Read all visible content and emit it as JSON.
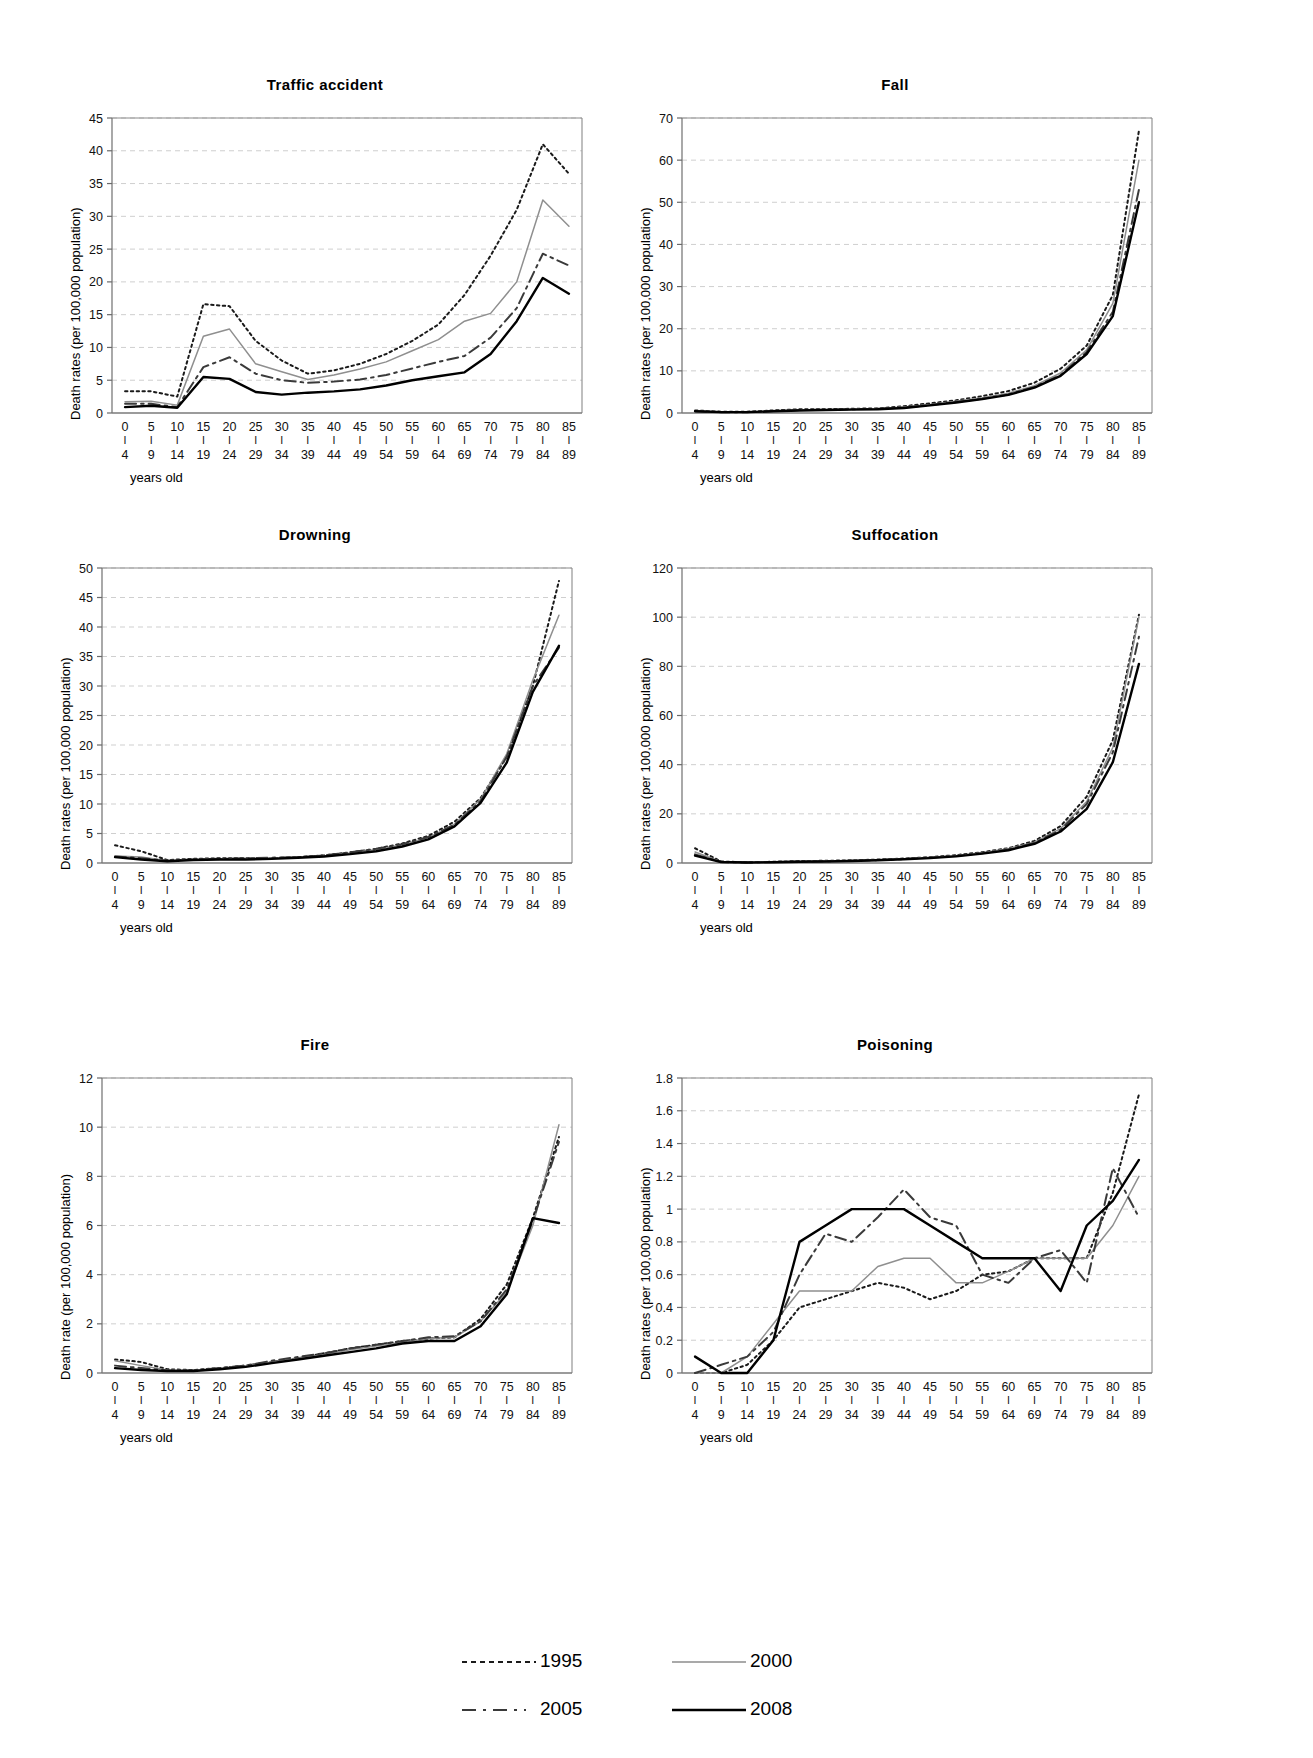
{
  "figure": {
    "xlabel": "years old",
    "ylabel_plural": "Death rates (per 100,000 population)",
    "ylabel_singular": "Death rate (per 100,000 population)",
    "age_top": [
      "0",
      "5",
      "10",
      "15",
      "20",
      "25",
      "30",
      "35",
      "40",
      "45",
      "50",
      "55",
      "60",
      "65",
      "70",
      "75",
      "80",
      "85"
    ],
    "age_bottom": [
      "4",
      "9",
      "14",
      "19",
      "24",
      "29",
      "34",
      "39",
      "44",
      "49",
      "54",
      "59",
      "64",
      "69",
      "74",
      "79",
      "84",
      "89"
    ],
    "tick_dash": "I"
  },
  "legend": {
    "position": "bottom-center",
    "items": [
      {
        "label": "1995",
        "style": "dotted",
        "color": "#1a1a1a"
      },
      {
        "label": "2000",
        "style": "solid-thin",
        "color": "#8c8c8c"
      },
      {
        "label": "2005",
        "style": "dash-dot",
        "color": "#3a3a3a"
      },
      {
        "label": "2008",
        "style": "solid-thick",
        "color": "#000000"
      }
    ]
  },
  "chart_data": [
    {
      "type": "line",
      "title": "Traffic accident",
      "xlabel": "years old",
      "ylabel": "Death rates (per 100,000 population)",
      "grid": true,
      "ylim": [
        0,
        45
      ],
      "yticks": [
        0,
        5,
        10,
        15,
        20,
        25,
        30,
        35,
        40,
        45
      ],
      "categories": [
        "0-4",
        "5-9",
        "10-14",
        "15-19",
        "20-24",
        "25-29",
        "30-34",
        "35-39",
        "40-44",
        "45-49",
        "50-54",
        "55-59",
        "60-64",
        "65-69",
        "70-74",
        "75-79",
        "80-84",
        "85-89"
      ],
      "series": [
        {
          "name": "1995",
          "values": [
            3.3,
            3.3,
            2.5,
            16.6,
            16.3,
            11.0,
            8.0,
            6.0,
            6.5,
            7.5,
            9.0,
            11.0,
            13.5,
            18.0,
            24.0,
            31.0,
            41.0,
            36.5
          ]
        },
        {
          "name": "2000",
          "values": [
            1.7,
            1.8,
            1.2,
            11.7,
            12.8,
            7.5,
            6.3,
            5.1,
            5.8,
            6.7,
            7.8,
            9.5,
            11.2,
            14.0,
            15.2,
            20.0,
            32.5,
            28.5
          ]
        },
        {
          "name": "2005",
          "values": [
            1.4,
            1.4,
            0.9,
            7.0,
            8.5,
            6.0,
            5.0,
            4.6,
            4.8,
            5.1,
            5.8,
            6.8,
            7.8,
            8.7,
            11.5,
            16.0,
            24.3,
            22.5
          ]
        },
        {
          "name": "2008",
          "values": [
            0.9,
            1.1,
            0.8,
            5.5,
            5.2,
            3.2,
            2.8,
            3.1,
            3.3,
            3.6,
            4.2,
            5.0,
            5.6,
            6.2,
            9.0,
            14.0,
            20.6,
            18.2
          ]
        }
      ]
    },
    {
      "type": "line",
      "title": "Fall",
      "xlabel": "years old",
      "ylabel": "Death rates (per 100,000 population)",
      "grid": true,
      "ylim": [
        0,
        70
      ],
      "yticks": [
        0,
        10,
        20,
        30,
        40,
        50,
        60,
        70
      ],
      "categories": [
        "0-4",
        "5-9",
        "10-14",
        "15-19",
        "20-24",
        "25-29",
        "30-34",
        "35-39",
        "40-44",
        "45-49",
        "50-54",
        "55-59",
        "60-64",
        "65-69",
        "70-74",
        "75-79",
        "80-84",
        "85-89"
      ],
      "series": [
        {
          "name": "1995",
          "values": [
            0.6,
            0.3,
            0.3,
            0.6,
            0.9,
            0.9,
            1.0,
            1.1,
            1.6,
            2.3,
            3.0,
            4.0,
            5.2,
            7.2,
            10.5,
            16.0,
            28.0,
            67.0
          ]
        },
        {
          "name": "2000",
          "values": [
            0.5,
            0.3,
            0.2,
            0.5,
            0.8,
            0.8,
            0.9,
            1.0,
            1.4,
            2.0,
            2.8,
            3.6,
            4.7,
            6.5,
            9.5,
            15.0,
            26.0,
            60.0
          ]
        },
        {
          "name": "2005",
          "values": [
            0.4,
            0.2,
            0.2,
            0.5,
            0.7,
            0.8,
            0.9,
            1.0,
            1.3,
            1.9,
            2.6,
            3.4,
            4.4,
            6.2,
            9.0,
            14.5,
            24.0,
            53.0
          ]
        },
        {
          "name": "2008",
          "values": [
            0.4,
            0.2,
            0.2,
            0.4,
            0.6,
            0.7,
            0.8,
            0.9,
            1.2,
            1.8,
            2.5,
            3.3,
            4.3,
            6.0,
            8.8,
            14.0,
            23.0,
            50.0
          ]
        }
      ]
    },
    {
      "type": "line",
      "title": "Drowning",
      "xlabel": "years old",
      "ylabel": "Death rates (per 100,000 population)",
      "grid": true,
      "ylim": [
        0,
        50
      ],
      "yticks": [
        0,
        5,
        10,
        15,
        20,
        25,
        30,
        35,
        40,
        45,
        50
      ],
      "categories": [
        "0-4",
        "5-9",
        "10-14",
        "15-19",
        "20-24",
        "25-29",
        "30-34",
        "35-39",
        "40-44",
        "45-49",
        "50-54",
        "55-59",
        "60-64",
        "65-69",
        "70-74",
        "75-79",
        "80-84",
        "85-89"
      ],
      "series": [
        {
          "name": "1995",
          "values": [
            3.0,
            2.0,
            0.5,
            0.7,
            0.8,
            0.8,
            0.8,
            1.0,
            1.3,
            1.8,
            2.4,
            3.3,
            4.6,
            7.0,
            11.0,
            18.0,
            30.0,
            47.8
          ]
        },
        {
          "name": "2000",
          "values": [
            1.2,
            1.0,
            0.4,
            0.6,
            0.7,
            0.7,
            0.8,
            0.9,
            1.2,
            1.7,
            2.3,
            3.1,
            4.3,
            6.6,
            10.8,
            18.5,
            31.0,
            42.0
          ]
        },
        {
          "name": "2005",
          "values": [
            1.1,
            0.8,
            0.4,
            0.6,
            0.7,
            0.8,
            0.9,
            1.0,
            1.3,
            1.8,
            2.4,
            3.2,
            4.4,
            6.5,
            10.5,
            18.0,
            30.0,
            36.5
          ]
        },
        {
          "name": "2008",
          "values": [
            1.0,
            0.6,
            0.3,
            0.5,
            0.6,
            0.6,
            0.7,
            0.9,
            1.1,
            1.5,
            2.0,
            2.8,
            4.0,
            6.2,
            10.2,
            17.0,
            29.0,
            36.8
          ]
        }
      ]
    },
    {
      "type": "line",
      "title": "Suffocation",
      "xlabel": "years old",
      "ylabel": "Death rates (per 100,000 population)",
      "grid": true,
      "ylim": [
        0,
        120
      ],
      "yticks": [
        0,
        20,
        40,
        60,
        80,
        100,
        120
      ],
      "categories": [
        "0-4",
        "5-9",
        "10-14",
        "15-19",
        "20-24",
        "25-29",
        "30-34",
        "35-39",
        "40-44",
        "45-49",
        "50-54",
        "55-59",
        "60-64",
        "65-69",
        "70-74",
        "75-79",
        "80-84",
        "85-89"
      ],
      "series": [
        {
          "name": "1995",
          "values": [
            6.0,
            0.6,
            0.3,
            0.5,
            0.8,
            0.9,
            1.1,
            1.4,
            1.8,
            2.4,
            3.2,
            4.4,
            6.0,
            9.0,
            15.0,
            27.0,
            50.0,
            101.0
          ]
        },
        {
          "name": "2000",
          "values": [
            4.5,
            0.5,
            0.3,
            0.4,
            0.6,
            0.8,
            1.0,
            1.3,
            1.7,
            2.3,
            3.0,
            4.2,
            5.8,
            8.5,
            14.0,
            25.0,
            47.0,
            100.0
          ]
        },
        {
          "name": "2005",
          "values": [
            3.5,
            0.4,
            0.2,
            0.4,
            0.6,
            0.7,
            0.9,
            1.2,
            1.6,
            2.2,
            2.9,
            4.0,
            5.5,
            8.2,
            13.5,
            24.0,
            45.0,
            92.0
          ]
        },
        {
          "name": "2008",
          "values": [
            3.0,
            0.4,
            0.2,
            0.3,
            0.5,
            0.6,
            0.8,
            1.1,
            1.5,
            2.0,
            2.7,
            3.8,
            5.2,
            7.8,
            12.8,
            22.0,
            41.0,
            81.0
          ]
        }
      ]
    },
    {
      "type": "line",
      "title": "Fire",
      "xlabel": "years old",
      "ylabel": "Death rate (per 100,000 population)",
      "grid": true,
      "ylim": [
        0,
        12
      ],
      "yticks": [
        0,
        2,
        4,
        6,
        8,
        10,
        12
      ],
      "categories": [
        "0-4",
        "5-9",
        "10-14",
        "15-19",
        "20-24",
        "25-29",
        "30-34",
        "35-39",
        "40-44",
        "45-49",
        "50-54",
        "55-59",
        "60-64",
        "65-69",
        "70-74",
        "75-79",
        "80-84",
        "85-89"
      ],
      "series": [
        {
          "name": "1995",
          "values": [
            0.55,
            0.45,
            0.15,
            0.12,
            0.2,
            0.3,
            0.45,
            0.6,
            0.8,
            1.0,
            1.15,
            1.3,
            1.4,
            1.45,
            2.2,
            3.6,
            6.3,
            9.6
          ]
        },
        {
          "name": "2000",
          "values": [
            0.5,
            0.3,
            0.12,
            0.1,
            0.18,
            0.3,
            0.45,
            0.6,
            0.75,
            0.95,
            1.1,
            1.25,
            1.4,
            1.45,
            2.1,
            3.3,
            6.0,
            10.1
          ]
        },
        {
          "name": "2005",
          "values": [
            0.3,
            0.2,
            0.1,
            0.1,
            0.2,
            0.3,
            0.5,
            0.65,
            0.8,
            1.0,
            1.15,
            1.3,
            1.45,
            1.5,
            2.1,
            3.4,
            6.2,
            9.4
          ]
        },
        {
          "name": "2008",
          "values": [
            0.2,
            0.12,
            0.08,
            0.08,
            0.15,
            0.25,
            0.4,
            0.55,
            0.7,
            0.85,
            1.0,
            1.2,
            1.3,
            1.3,
            1.9,
            3.2,
            6.3,
            6.1
          ]
        }
      ]
    },
    {
      "type": "line",
      "title": "Poisoning",
      "xlabel": "years old",
      "ylabel": "Death rates (per 100,000 population)",
      "grid": true,
      "ylim": [
        0,
        1.8
      ],
      "yticks": [
        0,
        0.2,
        0.4,
        0.6,
        0.8,
        1,
        1.2,
        1.4,
        1.6,
        1.8
      ],
      "categories": [
        "0-4",
        "5-9",
        "10-14",
        "15-19",
        "20-24",
        "25-29",
        "30-34",
        "35-39",
        "40-44",
        "45-49",
        "50-54",
        "55-59",
        "60-64",
        "65-69",
        "70-74",
        "75-79",
        "80-84",
        "85-89"
      ],
      "series": [
        {
          "name": "1995",
          "values": [
            0.0,
            0.0,
            0.05,
            0.2,
            0.4,
            0.45,
            0.5,
            0.55,
            0.52,
            0.45,
            0.5,
            0.6,
            0.62,
            0.7,
            0.7,
            0.7,
            1.1,
            1.7
          ]
        },
        {
          "name": "2000",
          "values": [
            0.0,
            0.0,
            0.1,
            0.3,
            0.5,
            0.5,
            0.5,
            0.65,
            0.7,
            0.7,
            0.55,
            0.55,
            0.62,
            0.7,
            0.7,
            0.7,
            0.9,
            1.2
          ]
        },
        {
          "name": "2005",
          "values": [
            0.0,
            0.05,
            0.1,
            0.25,
            0.6,
            0.85,
            0.8,
            0.95,
            1.12,
            0.95,
            0.9,
            0.6,
            0.55,
            0.7,
            0.75,
            0.55,
            1.25,
            0.95
          ]
        },
        {
          "name": "2008",
          "values": [
            0.1,
            0.0,
            0.0,
            0.2,
            0.8,
            0.9,
            1.0,
            1.0,
            1.0,
            0.9,
            0.8,
            0.7,
            0.7,
            0.7,
            0.5,
            0.9,
            1.05,
            1.3
          ]
        }
      ]
    }
  ]
}
